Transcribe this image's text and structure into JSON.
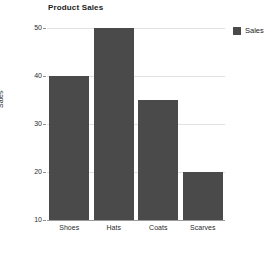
{
  "chart_data": {
    "type": "bar",
    "title": "Product Sales",
    "xlabel": "",
    "ylabel": "Sales",
    "categories": [
      "Shoes",
      "Hats",
      "Coats",
      "Scarves"
    ],
    "values": [
      40,
      50,
      35,
      20
    ],
    "series": [
      {
        "name": "Sales",
        "values": [
          40,
          50,
          35,
          20
        ]
      }
    ],
    "ylim": [
      10,
      50
    ],
    "yticks": [
      10,
      20,
      30,
      40,
      50
    ],
    "ytick_labels": [
      "10",
      "20",
      "30",
      "40",
      "50"
    ],
    "grid": true,
    "legend_position": "top-right",
    "legend": [
      "Sales"
    ],
    "bar_color": "#4a4a4a",
    "gridline_color": "#e2e2e2",
    "axis_color": "#9a9a9a",
    "background_color": "#ffffff",
    "text_color": "#2b2b2b"
  },
  "legend": {
    "entries": [
      {
        "label": "Sales",
        "color": "#4a4a4a"
      }
    ]
  }
}
